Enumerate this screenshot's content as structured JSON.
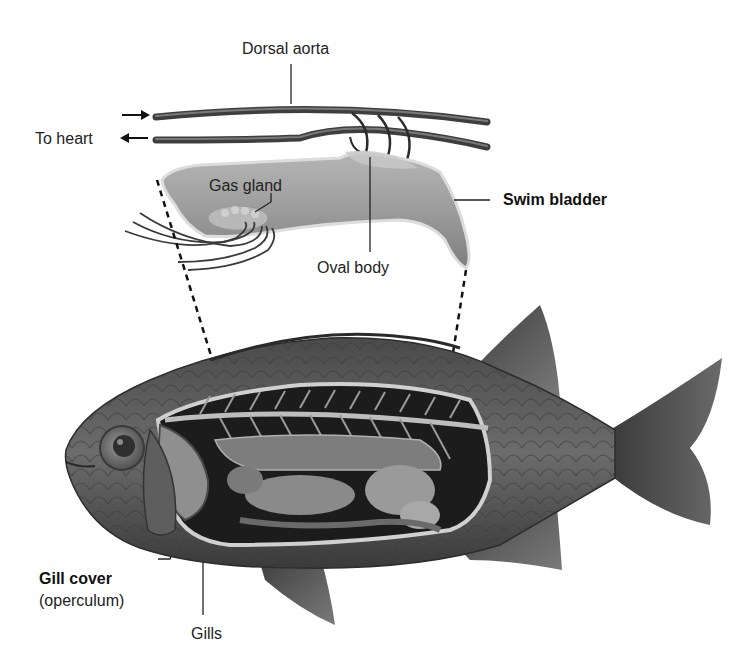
{
  "diagram": {
    "labels": {
      "dorsal_aorta": "Dorsal aorta",
      "to_heart": "To heart",
      "gas_gland": "Gas gland",
      "oval_body": "Oval body",
      "swim_bladder": "Swim bladder",
      "gill_cover": "Gill cover",
      "operculum": "(operculum)",
      "gills": "Gills"
    },
    "emphasized_labels": [
      "Swim bladder",
      "Gill cover"
    ],
    "colors": {
      "background": "#ffffff",
      "text": "#222222",
      "vessel": "#4a4a4a",
      "bladder_fill": "#9a9a9a",
      "bladder_edge": "#d8d8d8",
      "fish_body": "#555555",
      "fish_dark": "#2e2e2e",
      "cavity": "#1e1e1e",
      "organ": "#8c8c8c",
      "dashed_line": "#111111"
    }
  }
}
